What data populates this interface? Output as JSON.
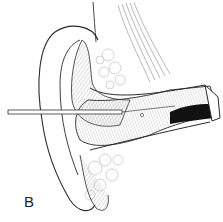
{
  "figure": {
    "panel_label": "B",
    "colors": {
      "background": "#ffffff",
      "line": "#2a2a2a",
      "hatch": "#8a8a8a",
      "fill_dark": "#111111"
    }
  }
}
